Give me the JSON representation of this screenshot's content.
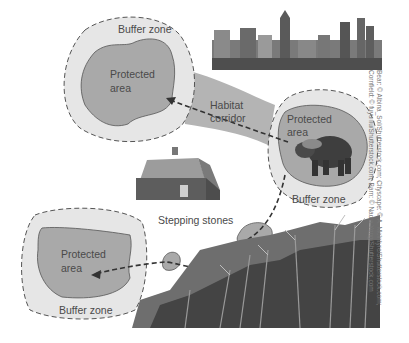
{
  "diagram": {
    "labels": {
      "buffer_zone_top_left": "Buffer zone",
      "protected_area_top_left_1": "Protected",
      "protected_area_top_left_2": "area",
      "habitat_corridor_1": "Habitat",
      "habitat_corridor_2": "corridor",
      "protected_area_right_1": "Protected",
      "protected_area_right_2": "area",
      "buffer_zone_right": "Buffer zone",
      "stepping_stones": "Stepping stones",
      "protected_area_bottom_left_1": "Protected",
      "protected_area_bottom_left_2": "area",
      "buffer_zone_bottom_left": "Buffer zone"
    },
    "illustrations": [
      "cityscape-photo",
      "barn-photo",
      "bear-photo",
      "cornfield-photo"
    ],
    "credit_line_1": "Bear: © Albina_Sol/Shutterstock.com; Cityscape: © A. McIntyre/Shutterstock.com;",
    "credit_line_2": "Cornfield: © fuyu liu/Shutterstock.com; Barn: © Nadia Yong/Shutterstock.com",
    "colors": {
      "protected_fill": "#a9a9a9",
      "buffer_fill": "#e6e6e6",
      "corridor_fill": "#b4b4b4",
      "outline": "#555555",
      "text": "#4a4a4a"
    }
  }
}
